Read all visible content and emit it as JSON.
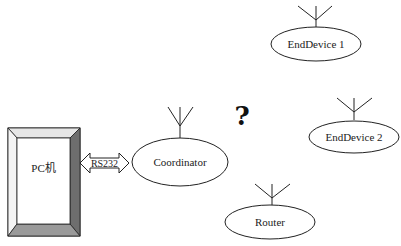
{
  "diagram": {
    "pc": {
      "label": "PC机"
    },
    "link": {
      "label": "RS232"
    },
    "unknown_connection": {
      "symbol": "?"
    },
    "nodes": [
      {
        "id": "coordinator",
        "label": "Coordinator"
      },
      {
        "id": "enddevice1",
        "label": "EndDevice 1"
      },
      {
        "id": "enddevice2",
        "label": "EndDevice 2"
      },
      {
        "id": "router",
        "label": "Router"
      }
    ],
    "colors": {
      "stroke": "#222222",
      "bevel_light": "#ffffff",
      "bevel_right": "#6e6e6e",
      "bevel_bottom": "#9a9a9a",
      "bevel_top": "#e6e6e6"
    }
  }
}
